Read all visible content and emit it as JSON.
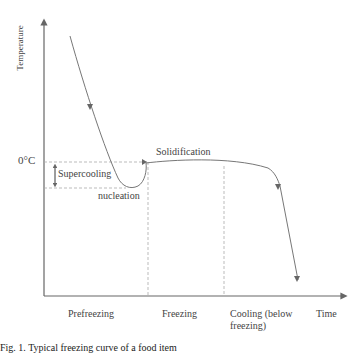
{
  "diagram": {
    "title": "Freezing curve",
    "y_axis_label": "Temperature",
    "x_axis_label": "Time",
    "y_tick": "0°C",
    "annotations": {
      "supercooling": "Supercooling",
      "nucleation": "nucleation",
      "solidification": "Solidification"
    },
    "phases": [
      {
        "label": "Prefreezing"
      },
      {
        "label": "Freezing"
      },
      {
        "label": "Cooling (below",
        "label2": "freezing)"
      }
    ],
    "colors": {
      "axis": "#666666",
      "curve": "#777777",
      "dashed": "#aaaaaa",
      "text": "#444444"
    }
  },
  "caption": "Fig. 1. Typical freezing curve of a food item"
}
